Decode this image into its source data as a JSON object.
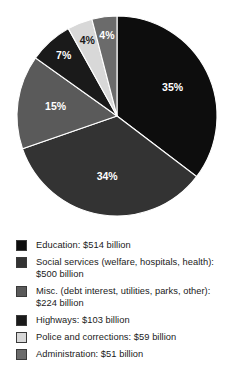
{
  "chart_data": {
    "type": "pie",
    "title": "",
    "subtitle": "",
    "xlabel": "",
    "ylabel": "",
    "grid": false,
    "legend_position": "bottom",
    "start_angle_deg": 0,
    "direction": "clockwise",
    "units": "billion USD",
    "categories": [
      "Education",
      "Social services (welfare, hospitals, health)",
      "Misc. (debt interest, utilities, parks, other)",
      "Highways",
      "Police and corrections",
      "Administration"
    ],
    "values": [
      514,
      500,
      224,
      103,
      59,
      51
    ],
    "percentages": [
      35,
      34,
      15,
      7,
      4,
      4
    ],
    "slice_labels": [
      "35%",
      "34%",
      "15%",
      "7%",
      "4%",
      "4%"
    ],
    "colors": [
      "#0d0d0d",
      "#333333",
      "#5a5a5a",
      "#1a1a1a",
      "#d8d8d8",
      "#6b6b6b"
    ],
    "slices": [
      {
        "label": "Education",
        "value": 514,
        "percent": 35,
        "percent_label": "35%",
        "color": "#0d0d0d",
        "label_color": "#ffffff"
      },
      {
        "label": "Social services (welfare, hospitals, health)",
        "value": 500,
        "percent": 34,
        "percent_label": "34%",
        "color": "#333333",
        "label_color": "#ffffff"
      },
      {
        "label": "Misc. (debt interest, utilities, parks, other)",
        "value": 224,
        "percent": 15,
        "percent_label": "15%",
        "color": "#5a5a5a",
        "label_color": "#ffffff"
      },
      {
        "label": "Highways",
        "value": 103,
        "percent": 7,
        "percent_label": "7%",
        "color": "#1a1a1a",
        "label_color": "#ffffff"
      },
      {
        "label": "Police and corrections",
        "value": 59,
        "percent": 4,
        "percent_label": "4%",
        "color": "#d8d8d8",
        "label_color": "#1a1a1a"
      },
      {
        "label": "Administration",
        "value": 51,
        "percent": 4,
        "percent_label": "4%",
        "color": "#6b6b6b",
        "label_color": "#ffffff"
      }
    ]
  },
  "pie": {
    "center_x": 117,
    "center_y": 116,
    "radius": 100,
    "labels": {
      "s0": "35%",
      "s1": "34%",
      "s2": "15%",
      "s3": "7%",
      "s4": "4%",
      "s5": "4%"
    }
  },
  "legend": {
    "rows": [
      {
        "swatch_color": "#0d0d0d",
        "text": "Education: $514 billion"
      },
      {
        "swatch_color": "#333333",
        "text": "Social services (welfare, hospitals, health): $500 billion"
      },
      {
        "swatch_color": "#5a5a5a",
        "text": "Misc. (debt interest, utilities, parks, other): $224 billion"
      },
      {
        "swatch_color": "#1a1a1a",
        "text": "Highways: $103 billion"
      },
      {
        "swatch_color": "#d8d8d8",
        "text": "Police and corrections: $59 billion"
      },
      {
        "swatch_color": "#6b6b6b",
        "text": "Administration: $51 billion"
      }
    ]
  }
}
